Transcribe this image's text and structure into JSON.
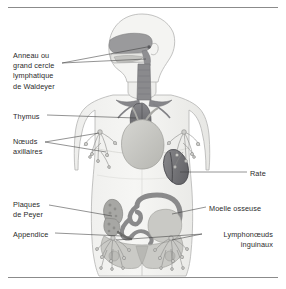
{
  "figure": {
    "background_color": "#ffffff",
    "rule_color": "#8b8b8b",
    "text_color": "#2b2b2b"
  },
  "palette": {
    "body_fill": "#f2f2f0",
    "body_outline": "#b4b4b2",
    "organ_light": "#cfcfcc",
    "organ_mid": "#a8a8a4",
    "organ_dark": "#77777a",
    "organ_darkest": "#5e5e61",
    "bone_fill": "#c8c8c4",
    "node_line": "#8a8a88",
    "leader_line": "#3a3a3a"
  },
  "labels": [
    {
      "id": "waldeyer",
      "text": "Anneau ou\ngrand cercle\nlymphatique\nde Waldeyer",
      "align": "left",
      "x": 13,
      "y": 51
    },
    {
      "id": "thymus",
      "text": "Thymus",
      "align": "left",
      "x": 13,
      "y": 112
    },
    {
      "id": "noeuds-axillaires",
      "text": "Nœuds\naxillaires",
      "align": "left",
      "x": 13,
      "y": 137
    },
    {
      "id": "plaques-de-peyer",
      "text": "Plaques\nde Peyer",
      "align": "left",
      "x": 13,
      "y": 200
    },
    {
      "id": "appendice",
      "text": "Appendice",
      "align": "left",
      "x": 13,
      "y": 230
    },
    {
      "id": "rate",
      "text": "Rate",
      "align": "left",
      "x": 250,
      "y": 169
    },
    {
      "id": "moelle-osseuse",
      "text": "Moelle osseuse",
      "align": "left",
      "x": 209,
      "y": 204
    },
    {
      "id": "lymphonoeuds-inguinaux",
      "text": "Lymphonœuds\ninguinaux",
      "align": "right",
      "x": 205,
      "y": 230
    }
  ],
  "anatomy": [
    {
      "id": "head",
      "name": "head-silhouette"
    },
    {
      "id": "nasal-pharynx",
      "name": "waldeyer-ring-region"
    },
    {
      "id": "trachea",
      "name": "trachea-and-bronchi"
    },
    {
      "id": "thymus-organ",
      "name": "thymus-organ"
    },
    {
      "id": "heart",
      "name": "heart-organ"
    },
    {
      "id": "spleen",
      "name": "spleen-organ"
    },
    {
      "id": "intestines",
      "name": "intestines"
    },
    {
      "id": "peyer-patches",
      "name": "peyer-patches"
    },
    {
      "id": "appendix-organ",
      "name": "appendix-organ"
    },
    {
      "id": "pelvis",
      "name": "pelvis-bone"
    },
    {
      "id": "axillary-nodes-left",
      "name": "axillary-node-chain-left"
    },
    {
      "id": "axillary-nodes-right",
      "name": "axillary-node-chain-right"
    },
    {
      "id": "inguinal-nodes-left",
      "name": "inguinal-node-chain-left"
    },
    {
      "id": "inguinal-nodes-right",
      "name": "inguinal-node-chain-right"
    }
  ]
}
